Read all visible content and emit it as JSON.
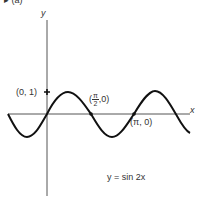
{
  "figure": {
    "partial_label": "▸ (a)",
    "y_axis_label": "y",
    "x_axis_label": "x",
    "equation": "y = sin  2x",
    "points": [
      {
        "label": "(0, 1)",
        "x": 0,
        "y": 1
      },
      {
        "label_prefix": "(",
        "label_num": "π",
        "label_den": "2",
        "label_suffix": ",0)",
        "x": 1.5708,
        "y": 0
      },
      {
        "label": "(π, 0)",
        "x": 3.1416,
        "y": 0
      }
    ]
  },
  "colors": {
    "curve": "#111111",
    "axis": "#555555",
    "text": "#333333"
  }
}
